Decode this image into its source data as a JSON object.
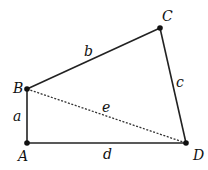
{
  "diagram": {
    "type": "quadrilateral",
    "colors": {
      "stroke": "#222222",
      "background": "#ffffff"
    },
    "vertices": [
      {
        "id": "A",
        "label": "A",
        "x": 27,
        "y": 143,
        "label_x": 18,
        "label_y": 161
      },
      {
        "id": "B",
        "label": "B",
        "x": 27,
        "y": 89,
        "label_x": 13,
        "label_y": 93
      },
      {
        "id": "C",
        "label": "C",
        "x": 160,
        "y": 28,
        "label_x": 162,
        "label_y": 21
      },
      {
        "id": "D",
        "label": "D",
        "x": 186,
        "y": 143,
        "label_x": 193,
        "label_y": 160
      }
    ],
    "edges": [
      {
        "id": "a",
        "label": "a",
        "from": "A",
        "to": "B",
        "style": "solid",
        "label_x": 13,
        "label_y": 121
      },
      {
        "id": "b",
        "label": "b",
        "from": "B",
        "to": "C",
        "style": "solid",
        "label_x": 84,
        "label_y": 56
      },
      {
        "id": "c",
        "label": "c",
        "from": "C",
        "to": "D",
        "style": "solid",
        "label_x": 176,
        "label_y": 87
      },
      {
        "id": "d",
        "label": "d",
        "from": "A",
        "to": "D",
        "style": "solid",
        "label_x": 103,
        "label_y": 159
      },
      {
        "id": "e",
        "label": "e",
        "from": "B",
        "to": "D",
        "style": "dotted",
        "label_x": 102,
        "label_y": 112
      }
    ]
  }
}
